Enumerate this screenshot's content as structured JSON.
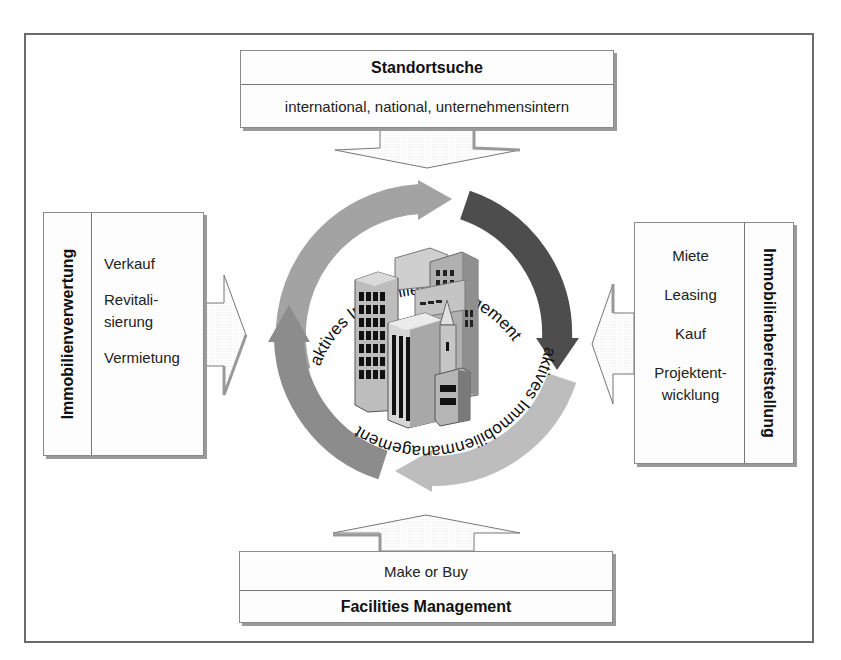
{
  "diagram": {
    "center": {
      "ring_text_top": "aktives Immobilienmanagement",
      "ring_text_bottom": "aktives Immobilienmanagement",
      "image": "city-buildings-icon",
      "arrow_colors": {
        "top_left": "#a3a3a3",
        "right": "#4d4d4d",
        "bottom_right": "#bdbdbd",
        "left": "#8c8c8c"
      }
    },
    "top": {
      "title": "Standortsuche",
      "subtitle": "international, national, unternehmensintern"
    },
    "bottom": {
      "subtitle": "Make or Buy",
      "title": "Facilities Management"
    },
    "left": {
      "title": "Immobilienverwertung",
      "items": [
        "Verkauf",
        "Revitali-",
        "sierung",
        "Vermietung"
      ]
    },
    "right": {
      "title": "Immobilienbereitstellung",
      "items": [
        "Miete",
        "Leasing",
        "Kauf",
        "Projektent-",
        "wicklung"
      ]
    }
  }
}
